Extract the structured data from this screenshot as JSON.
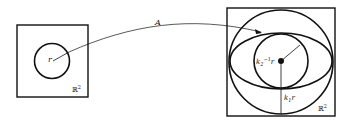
{
  "diagram": {
    "left_panel": {
      "radius_label": "r",
      "space_label": "ℝ",
      "space_exp": "2"
    },
    "arrow": {
      "label": "A"
    },
    "right_panel": {
      "inner_label_base": "k",
      "inner_label_sub": "2",
      "inner_label_sup": "−1",
      "inner_label_tail": "r",
      "outer_label_base": "k",
      "outer_label_sub": "1",
      "outer_label_tail": "r",
      "space_label": "ℝ",
      "space_exp": "2"
    },
    "colors": {
      "stroke": "#111111",
      "background": "#ffffff"
    }
  }
}
